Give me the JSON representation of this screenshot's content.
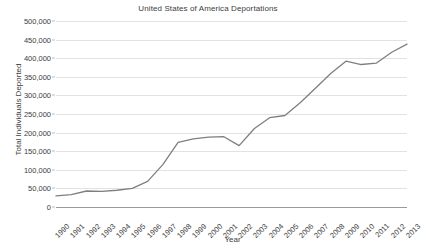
{
  "chart_data": {
    "type": "line",
    "title": "United States of America Deportations",
    "xlabel": "Year",
    "ylabel": "Total Individuals Deported",
    "categories": [
      "1990",
      "1991",
      "1992",
      "1993",
      "1994",
      "1995",
      "1996",
      "1997",
      "1998",
      "1999",
      "2000",
      "2001",
      "2002",
      "2003",
      "2004",
      "2005",
      "2006",
      "2007",
      "2008",
      "2009",
      "2010",
      "2011",
      "2012",
      "2013"
    ],
    "values": [
      30000,
      33000,
      43000,
      42000,
      45000,
      50000,
      69000,
      114000,
      174000,
      183000,
      188000,
      189000,
      165000,
      211000,
      240000,
      246000,
      280000,
      319000,
      359000,
      392000,
      383000,
      387000,
      416000,
      438000
    ],
    "series": [
      {
        "name": "Total Individuals Deported",
        "values": [
          30000,
          33000,
          43000,
          42000,
          45000,
          50000,
          69000,
          114000,
          174000,
          183000,
          188000,
          189000,
          165000,
          211000,
          240000,
          246000,
          280000,
          319000,
          359000,
          392000,
          383000,
          387000,
          416000,
          438000
        ]
      }
    ],
    "ylim": [
      0,
      500000
    ],
    "yticks": [
      0,
      50000,
      100000,
      150000,
      200000,
      250000,
      300000,
      350000,
      400000,
      450000,
      500000
    ],
    "ytick_labels": [
      "0",
      "50,000",
      "100,000",
      "150,000",
      "200,000",
      "250,000",
      "300,000",
      "350,000",
      "400,000",
      "450,000",
      "500,000"
    ],
    "grid": true,
    "legend": false,
    "legend_position": "none",
    "line_color": "#7f7f7f",
    "grid_color": "#e2e2e2",
    "axis_color": "#9a9a9a",
    "background_color": "#ffffff"
  }
}
